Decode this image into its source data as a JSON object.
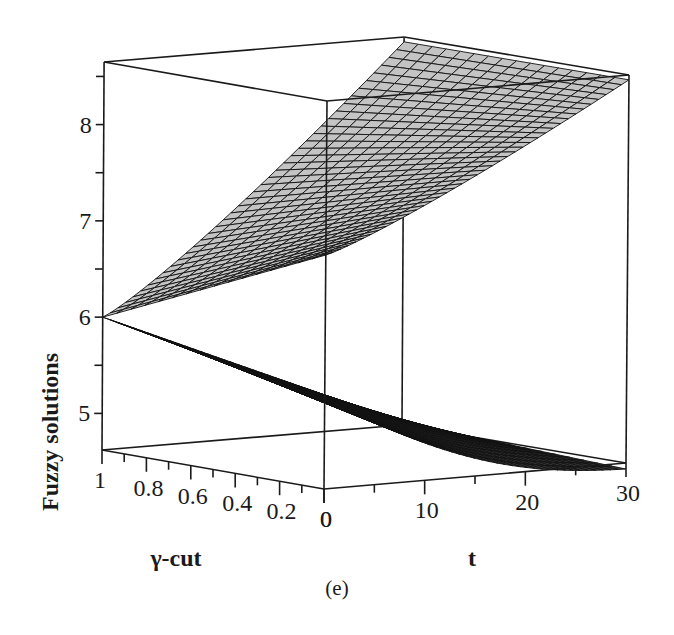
{
  "chart_data": {
    "type": "surface3d",
    "caption": "(e)",
    "xlabel": "γ-cut",
    "ylabel": "t",
    "zlabel": "Fuzzy solutions",
    "x_axis": {
      "name": "γ-cut",
      "range": [
        0,
        1
      ],
      "ticks": [
        "1",
        "0.8",
        "0.6",
        "0.4",
        "0.2",
        "0"
      ]
    },
    "y_axis": {
      "name": "t",
      "range": [
        0,
        30
      ],
      "ticks": [
        "0",
        "10",
        "20",
        "30"
      ]
    },
    "z_axis": {
      "name": "Fuzzy solutions",
      "range": [
        4.62,
        8.65
      ],
      "ticks": [
        "5",
        "6",
        "7",
        "8"
      ]
    },
    "grid": false,
    "box": true,
    "series": [
      {
        "name": "upper bound",
        "shade": "light",
        "color": "#bdbdbd",
        "points": {
          "gamma1_t0": 6.0,
          "gamma0_t0": 7.05,
          "gamma1_t30": 8.6,
          "gamma0_t30": 8.6
        }
      },
      {
        "name": "lower bound",
        "shade": "dark",
        "color": "#3a3a3a",
        "points": {
          "gamma1_t0": 6.0,
          "gamma0_t0": 5.55,
          "gamma1_t30": 4.65,
          "gamma0_t30": 4.65
        }
      }
    ]
  },
  "colors": {
    "line": "#1a1a1a",
    "surface_light": "#c4c4c4",
    "surface_dark": "#3c3c3c",
    "mesh": "#111111",
    "background": "#ffffff"
  }
}
